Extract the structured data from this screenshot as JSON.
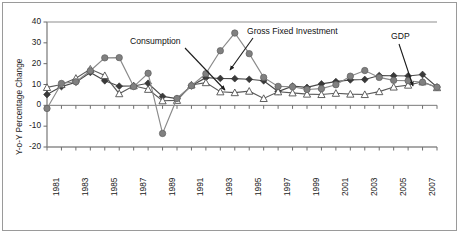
{
  "figure": {
    "border_color": "#9a9a9a",
    "background": "#ffffff"
  },
  "chart_data": {
    "type": "line",
    "title": "",
    "subtitle": "",
    "xlabel": "",
    "ylabel": "Y-o-Y Percentage Change",
    "ylim": [
      -20,
      40
    ],
    "yticks": [
      -20,
      -10,
      0,
      10,
      20,
      30,
      40
    ],
    "ytick_labels": [
      "-20",
      "-10",
      "0",
      "10",
      "20",
      "30",
      "40"
    ],
    "grid": false,
    "legend_position": "none",
    "zero_line": true,
    "x": [
      1981,
      1982,
      1983,
      1984,
      1985,
      1986,
      1987,
      1988,
      1989,
      1990,
      1991,
      1992,
      1993,
      1994,
      1995,
      1996,
      1997,
      1998,
      1999,
      2000,
      2001,
      2002,
      2003,
      2004,
      2005,
      2006,
      2007,
      2008
    ],
    "xtick_labels": [
      "1981",
      "1983",
      "1985",
      "1987",
      "1989",
      "1991",
      "1993",
      "1995",
      "1997",
      "1999",
      "2001",
      "2003",
      "2005",
      "2007"
    ],
    "xtick_years": [
      1981,
      1983,
      1985,
      1987,
      1989,
      1991,
      1993,
      1995,
      1997,
      1999,
      2001,
      2003,
      2005,
      2007
    ],
    "series": [
      {
        "name": "GDP",
        "marker": "filled-diamond",
        "color": "#3a3a3a",
        "line_color": "#4a4a4a",
        "values": [
          5.2,
          9.0,
          11.1,
          15.8,
          11.8,
          9.2,
          9.3,
          10.6,
          4.3,
          3.2,
          9.4,
          13.3,
          12.9,
          12.8,
          12.5,
          11.8,
          6.6,
          9.2,
          8.6,
          10.3,
          11.4,
          12.2,
          12.4,
          14.3,
          14.2,
          14.1,
          14.8,
          8.8
        ]
      },
      {
        "name": "Consumption",
        "marker": "open-triangle",
        "color": "#ffffff",
        "line_color": "#5a5a5a",
        "values": [
          8.6,
          10.0,
          13.0,
          17.4,
          14.3,
          5.6,
          9.4,
          7.7,
          2.2,
          2.4,
          9.8,
          10.9,
          6.5,
          6.1,
          6.8,
          3.3,
          6.5,
          6.0,
          5.4,
          5.2,
          5.8,
          5.4,
          5.2,
          6.6,
          8.8,
          9.7,
          11.3,
          8.5
        ]
      },
      {
        "name": "Gross Fixed Investment",
        "marker": "filled-circle",
        "color": "#808080",
        "line_color": "#8a8a8a",
        "values": [
          -1.5,
          10.5,
          11.3,
          16.6,
          22.8,
          22.9,
          9.0,
          15.4,
          -13.5,
          3.3,
          9.4,
          15.2,
          26.2,
          34.7,
          24.8,
          13.4,
          9.1,
          8.9,
          7.6,
          8.0,
          9.9,
          14.0,
          16.7,
          13.4,
          12.0,
          11.8,
          11.1,
          8.7
        ]
      }
    ],
    "annotations": [
      {
        "text": "Consumption",
        "text_x": 130,
        "text_y": 36,
        "arrow_from_x": 185,
        "arrow_from_y": 48,
        "arrow_to_x": 225,
        "arrow_to_y": 90
      },
      {
        "text": "Gross Fixed Investment",
        "text_x": 247,
        "text_y": 26,
        "arrow_from_x": 253,
        "arrow_from_y": 38,
        "arrow_to_x": 230,
        "arrow_to_y": 70
      },
      {
        "text": "GDP",
        "text_x": 391,
        "text_y": 31,
        "arrow_from_x": 399,
        "arrow_from_y": 44,
        "arrow_to_x": 413,
        "arrow_to_y": 86
      }
    ]
  }
}
